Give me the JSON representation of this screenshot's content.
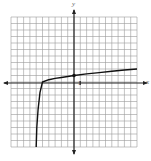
{
  "chart_data": {
    "type": "line",
    "title": "",
    "xlabel": "x",
    "ylabel": "y",
    "xlim": [
      -10,
      10
    ],
    "ylim": [
      -10,
      10
    ],
    "grid": true,
    "tick_labels": {
      "x": [
        "1"
      ]
    },
    "series": [
      {
        "name": "curve",
        "description": "logarithmic curve with vertical asymptote near x = -6, passing through (-5, 0) and (0, 1)",
        "x": [
          -6.0,
          -5.9,
          -5.7,
          -5.4,
          -5.0,
          -4.0,
          -3.0,
          -2.0,
          0.0,
          2.0,
          4.0,
          6.0,
          8.0,
          10.0
        ],
        "y": [
          -10.0,
          -7.0,
          -4.2,
          -1.6,
          0.0,
          0.35,
          0.55,
          0.7,
          1.0,
          1.25,
          1.45,
          1.65,
          1.85,
          2.0
        ]
      }
    ],
    "marked_points": [
      {
        "x": 0,
        "y": 1
      }
    ]
  },
  "labels": {
    "x_axis": "x",
    "y_axis": "y",
    "unit_tick": "1"
  }
}
